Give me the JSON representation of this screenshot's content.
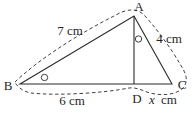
{
  "colors": {
    "line": "#2b2b2b",
    "background": "#ffffff"
  },
  "vertices": {
    "a": "A",
    "b": "B",
    "c": "C",
    "d": "D"
  },
  "side_labels": {
    "ab": "7 cm",
    "ac": "4 cm",
    "bd": "6 cm",
    "dc_value": "x",
    "dc_unit": "cm"
  }
}
